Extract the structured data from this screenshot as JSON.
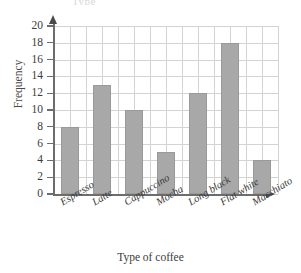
{
  "figure": {
    "top_remnant_text": "Type",
    "axis": {
      "y_title": "Frequency",
      "x_title": "Type of coffee",
      "y_ticks": [
        "0",
        "2",
        "4",
        "6",
        "8",
        "10",
        "12",
        "14",
        "16",
        "18",
        "20"
      ],
      "y_min": 0,
      "y_max": 20,
      "y_step": 2,
      "y_arrow": "arrow-up-icon",
      "x_arrow": "arrow-right-icon"
    },
    "colors": {
      "bar_fill": "#a8a8a8",
      "bar_stroke": "#9a9a9a",
      "gridline": "#d3d3d3",
      "axis": "#6d6d6d",
      "text": "#3b3b3b",
      "background": "#ffffff"
    }
  },
  "chart_data": {
    "type": "bar",
    "title": "",
    "xlabel": "Type of coffee",
    "ylabel": "Frequency",
    "ylim": [
      0,
      20
    ],
    "ytick_step": 2,
    "grid": true,
    "legend": false,
    "orientation": "vertical",
    "categories": [
      "Espresso",
      "Latte",
      "Cappuccino",
      "Mocha",
      "Long black",
      "Flat white",
      "Macchiato"
    ],
    "values": [
      8,
      13,
      10,
      5,
      12,
      18,
      4
    ]
  }
}
